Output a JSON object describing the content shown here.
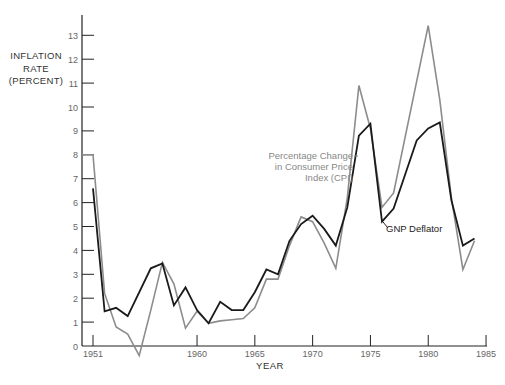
{
  "chart_data": {
    "type": "line",
    "title": "",
    "xlabel": "YEAR",
    "ylabel": "INFLATION RATE (PERCENT)",
    "ylabel_lines": [
      "INFLATION",
      "RATE",
      "(PERCENT)"
    ],
    "xlim": [
      1950,
      1985
    ],
    "ylim": [
      0,
      13.5
    ],
    "x_ticks": [
      1951,
      1960,
      1965,
      1970,
      1975,
      1980,
      1985
    ],
    "y_ticks": [
      0,
      1,
      2,
      3,
      4,
      5,
      6,
      7,
      8,
      9,
      10,
      11,
      12,
      13
    ],
    "grid": false,
    "legend": "inline annotations",
    "series": [
      {
        "name": "Percentage Change in Consumer Price Index (CPI)",
        "color": "#8c8c8c",
        "x": [
          1950,
          1951,
          1952,
          1953,
          1954,
          1955,
          1956,
          1957,
          1958,
          1959,
          1960,
          1961,
          1962,
          1963,
          1964,
          1965,
          1966,
          1967,
          1968,
          1969,
          1970,
          1971,
          1972,
          1973,
          1974,
          1975,
          1976,
          1977,
          1980,
          1981,
          1982,
          1983,
          1984
        ],
        "values": [
          8.0,
          8.0,
          2.2,
          0.8,
          0.5,
          -0.4,
          1.5,
          3.5,
          2.6,
          0.75,
          1.45,
          0.95,
          1.05,
          1.1,
          1.15,
          1.6,
          2.8,
          2.8,
          4.2,
          5.4,
          5.2,
          4.3,
          3.25,
          6.2,
          10.9,
          9.1,
          5.8,
          6.4,
          13.4,
          10.3,
          6.2,
          3.2,
          4.4
        ]
      },
      {
        "name": "GNP Deflator",
        "color": "#1a1a1a",
        "x": [
          1951,
          1952,
          1953,
          1954,
          1956,
          1957,
          1958,
          1959,
          1960,
          1961,
          1962,
          1963,
          1964,
          1965,
          1966,
          1967,
          1968,
          1969,
          1970,
          1971,
          1972,
          1973,
          1974,
          1975,
          1976,
          1977,
          1979,
          1980,
          1981,
          1982,
          1983,
          1984
        ],
        "values": [
          6.6,
          1.45,
          1.6,
          1.25,
          3.25,
          3.45,
          1.7,
          2.45,
          1.5,
          0.95,
          1.85,
          1.5,
          1.5,
          2.25,
          3.2,
          3.0,
          4.4,
          5.1,
          5.45,
          4.9,
          4.2,
          5.8,
          8.8,
          9.3,
          5.2,
          5.75,
          8.6,
          9.1,
          9.35,
          6.1,
          4.2,
          4.5
        ]
      }
    ],
    "annotations": {
      "cpi_label": [
        "Percentage Change",
        "in Consumer Price",
        "Index (CPI)"
      ],
      "gnp_label": "GNP Deflator"
    }
  }
}
